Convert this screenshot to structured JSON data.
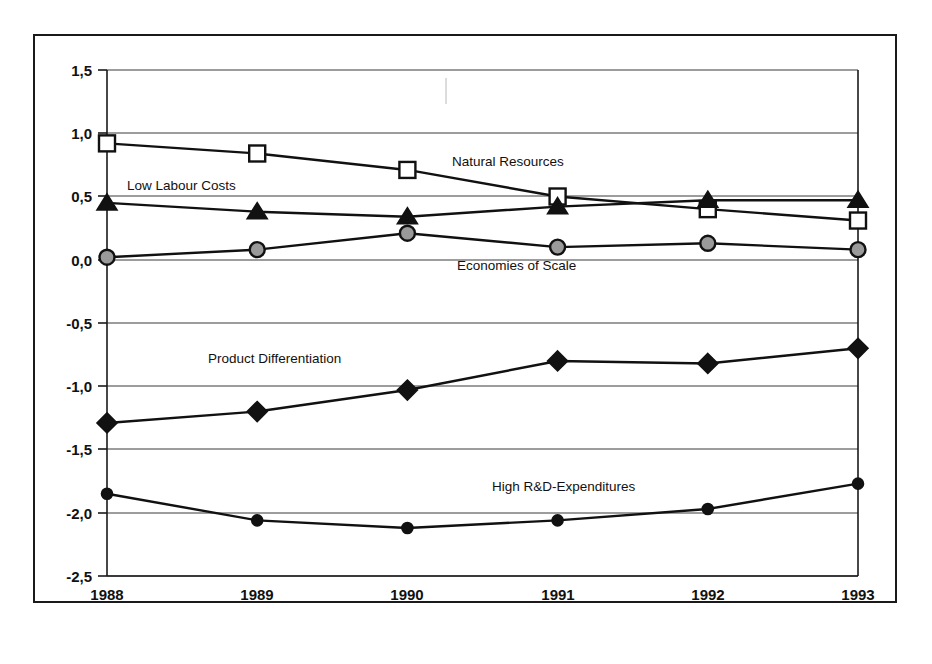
{
  "figure": {
    "title": "",
    "border_color": "#1a1a1a",
    "background": "#ffffff"
  },
  "axes": {
    "y_ticks": [
      "1,5",
      "1,0",
      "0,5",
      "0,0",
      "-0,5",
      "-1,0",
      "-1,5",
      "-2,0",
      "-2,5"
    ],
    "x_ticks": [
      "1988",
      "1989",
      "1990",
      "1991",
      "1992",
      "1993"
    ]
  },
  "series_labels": {
    "natural_resources": "Natural Resources",
    "low_labour_costs": "Low Labour Costs",
    "economies_of_scale": "Economies of Scale",
    "product_differentiation": "Product Differentiation",
    "high_rd_expenditures": "High R&D-Expenditures"
  },
  "chart_data": {
    "type": "line",
    "title": "",
    "xlabel": "",
    "ylabel": "",
    "x": [
      1988,
      1989,
      1990,
      1991,
      1992,
      1993
    ],
    "categories": [
      "1988",
      "1989",
      "1990",
      "1991",
      "1992",
      "1993"
    ],
    "ylim": [
      -2.5,
      1.5
    ],
    "yticks": [
      1.5,
      1.0,
      0.5,
      0.0,
      -0.5,
      -1.0,
      -1.5,
      -2.0,
      -2.5
    ],
    "ytick_labels": [
      "1,5",
      "1,0",
      "0,5",
      "0,0",
      "-0,5",
      "-1,0",
      "-1,5",
      "-2,0",
      "-2,5"
    ],
    "grid": true,
    "grid_axis": "y",
    "legend": "inline-annotations",
    "decimal_separator": "comma",
    "series": [
      {
        "name": "Natural Resources",
        "marker": "open-square",
        "marker_fill": "#ffffff",
        "color": "#111111",
        "values": [
          0.92,
          0.84,
          0.71,
          0.5,
          0.4,
          0.31
        ],
        "label_position": {
          "x": 1990.45,
          "y": 0.76
        }
      },
      {
        "name": "Low Labour Costs",
        "marker": "solid-triangle",
        "marker_fill": "#111111",
        "color": "#111111",
        "values": [
          0.45,
          0.38,
          0.34,
          0.42,
          0.47,
          0.47
        ],
        "label_position": {
          "x": 1988.35,
          "y": 0.58
        }
      },
      {
        "name": "Economies of Scale",
        "marker": "gray-circle",
        "marker_fill": "#9a9a9a",
        "color": "#111111",
        "values": [
          0.02,
          0.08,
          0.21,
          0.1,
          0.13,
          0.08
        ],
        "label_position": {
          "x": 1990.95,
          "y": -0.05
        }
      },
      {
        "name": "Product Differentiation",
        "marker": "solid-diamond",
        "marker_fill": "#111111",
        "color": "#111111",
        "values": [
          -1.29,
          -1.2,
          -1.03,
          -0.8,
          -0.82,
          -0.7
        ],
        "label_position": {
          "x": 1989.45,
          "y": -0.79
        }
      },
      {
        "name": "High R&D-Expenditures",
        "marker": "small-solid-circle",
        "marker_fill": "#111111",
        "color": "#111111",
        "values": [
          -1.85,
          -2.06,
          -2.12,
          -2.06,
          -1.97,
          -1.77
        ],
        "label_position": {
          "x": 1991.05,
          "y": -1.68
        }
      }
    ]
  }
}
